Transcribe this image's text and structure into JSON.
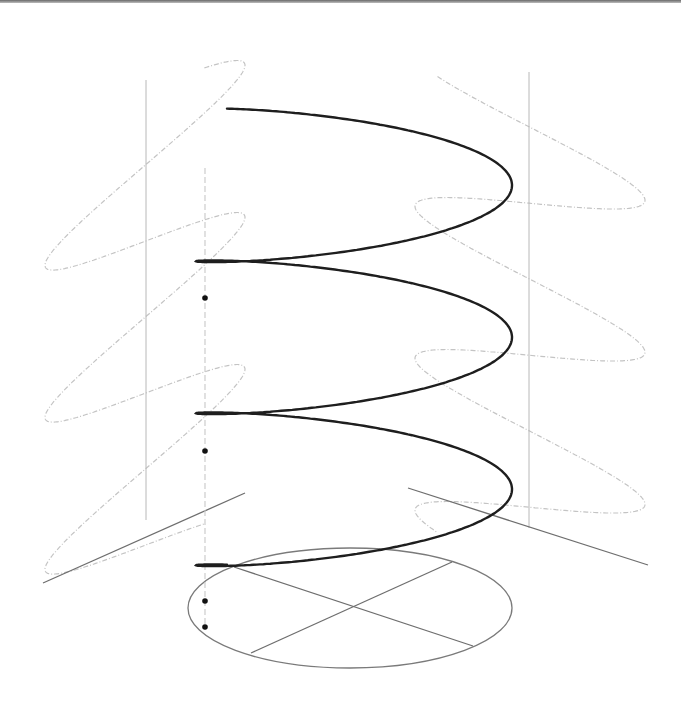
{
  "diagram": {
    "title": "Circular helix with orthogonal projections",
    "colors": {
      "helix": "#1e1e1e",
      "base_circle": "#7a7a7a",
      "axes": "#6e6e6e",
      "projection_curves": "#c4c4c4",
      "projection_axes": "#b8b8b8",
      "axis_dashed": "#c8c8c8",
      "points": "#111111",
      "top_border": "#707070"
    },
    "helix": {
      "turns": 3,
      "center_x": 354,
      "radius_x": 158,
      "radius_y": 27,
      "top_y": 138,
      "pitch": 152,
      "start_angle_deg": 248
    },
    "base_circle": {
      "cx": 350,
      "cy": 608,
      "rx": 162,
      "ry": 60
    },
    "base_axes": [
      {
        "name": "axis-1",
        "x1": 234,
        "y1": 567,
        "x2": 473,
        "y2": 646
      },
      {
        "name": "axis-2",
        "x1": 251,
        "y1": 653,
        "x2": 452,
        "y2": 562
      }
    ],
    "left_plane": {
      "vertical": {
        "x": 146,
        "y1": 80,
        "y2": 520
      },
      "ground_line": {
        "x1": 43,
        "y1": 583,
        "x2": 245,
        "y2": 493
      }
    },
    "right_plane": {
      "vertical": {
        "x": 529,
        "y1": 72,
        "y2": 528
      },
      "ground_line": {
        "x1": 408,
        "y1": 488,
        "x2": 648,
        "y2": 565
      }
    },
    "central_axis": {
      "x": 205,
      "y1": 168,
      "y2": 630
    },
    "points": [
      {
        "label": "P1",
        "x": 205,
        "y": 298
      },
      {
        "label": "P2",
        "x": 205,
        "y": 451
      },
      {
        "label": "P3",
        "x": 205,
        "y": 601
      },
      {
        "label": "P0",
        "x": 205,
        "y": 627
      }
    ]
  }
}
